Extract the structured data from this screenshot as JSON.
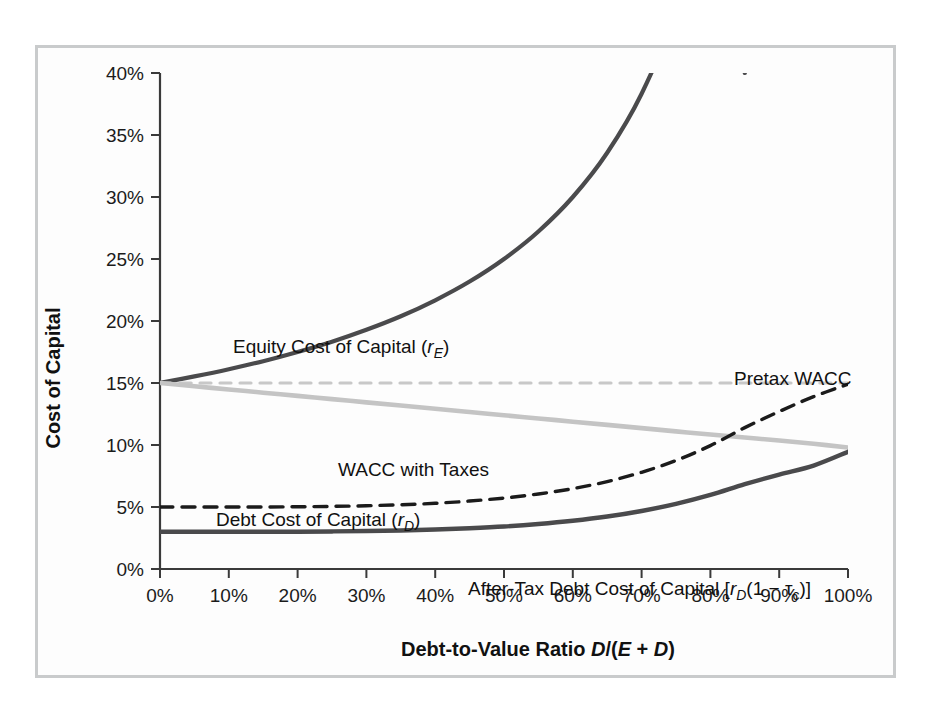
{
  "figure": {
    "background_color": "#fdfdfd",
    "border_color": "#c9cbcc"
  },
  "chart_data": {
    "type": "line",
    "title": "",
    "xlabel_parts": {
      "lead": "Debt-to-Value Ratio ",
      "d": "D",
      "slash": "/(",
      "e": "E",
      "plus": " + ",
      "d2": "D",
      "close": ")"
    },
    "xlabel": "Debt-to-Value Ratio D/(E + D)",
    "ylabel": "Cost of Capital",
    "xlim": [
      0,
      100
    ],
    "ylim": [
      0,
      40
    ],
    "grid": false,
    "legend_position": "inline-annotations",
    "xticks": [
      "0%",
      "10%",
      "20%",
      "30%",
      "40%",
      "50%",
      "60%",
      "70%",
      "80%",
      "90%",
      "100%"
    ],
    "xtick_values": [
      0,
      10,
      20,
      30,
      40,
      50,
      60,
      70,
      80,
      90,
      100
    ],
    "yticks": [
      "0%",
      "5%",
      "10%",
      "15%",
      "20%",
      "25%",
      "30%",
      "35%",
      "40%"
    ],
    "ytick_values": [
      0,
      5,
      10,
      15,
      20,
      25,
      30,
      35,
      40
    ],
    "x": [
      0,
      5,
      10,
      15,
      20,
      25,
      30,
      35,
      40,
      45,
      50,
      55,
      60,
      65,
      70,
      75,
      80,
      85,
      90,
      95,
      100
    ],
    "series": [
      {
        "name": "Equity Cost of Capital",
        "symbol": "rE",
        "color": "#4a4a4c",
        "style": "solid",
        "width": 4.2,
        "values": [
          15.0,
          15.53,
          16.11,
          16.76,
          17.5,
          18.33,
          19.29,
          20.38,
          21.67,
          23.18,
          25.0,
          27.22,
          30.0,
          33.57,
          38.33,
          45.0,
          55.0,
          40.0,
          null,
          null,
          null
        ],
        "clip_top": 40,
        "label": {
          "text": "Equity Cost of Capital (r",
          "sub": "E",
          "tail": ")",
          "x_px": 195,
          "y_px": 305
        }
      },
      {
        "name": "Pretax WACC",
        "color": "#c8c8c8",
        "style": "dashed",
        "width": 3.2,
        "values": [
          15.0,
          15.0,
          15.0,
          15.0,
          15.0,
          15.0,
          15.0,
          15.0,
          15.0,
          15.0,
          15.0,
          15.0,
          15.0,
          15.0,
          15.0,
          15.0,
          15.0,
          15.0,
          15.0,
          15.0,
          15.0
        ],
        "label": {
          "text": "Pretax WACC",
          "x_px": 696,
          "y_px": 337
        }
      },
      {
        "name": "WACC with Taxes",
        "color": "#c4c4c4",
        "style": "solid",
        "width": 4.6,
        "values": [
          15.0,
          14.74,
          14.48,
          14.22,
          13.96,
          13.7,
          13.44,
          13.18,
          12.92,
          12.66,
          12.4,
          12.14,
          11.88,
          11.62,
          11.36,
          11.1,
          10.84,
          10.6,
          10.36,
          10.1,
          9.8
        ],
        "label": {
          "text": "WACC with Taxes",
          "x_px": 300,
          "y_px": 428
        }
      },
      {
        "name": "Debt Cost of Capital",
        "symbol": "rD",
        "color": "#1b1b1b",
        "style": "dashed",
        "width": 3.4,
        "values": [
          5.0,
          5.0,
          5.0,
          5.0,
          5.02,
          5.05,
          5.1,
          5.18,
          5.3,
          5.48,
          5.72,
          6.05,
          6.48,
          7.05,
          7.8,
          8.75,
          9.95,
          11.4,
          12.7,
          13.9,
          14.9
        ],
        "label": {
          "text": "Debt Cost of Capital (r",
          "sub": "D",
          "tail": ")",
          "x_px": 178,
          "y_px": 478
        }
      },
      {
        "name": "After-Tax Debt Cost of Capital",
        "symbol": "rD(1-tc)",
        "color": "#4a4a4c",
        "style": "solid",
        "width": 4.4,
        "values": [
          3.0,
          3.0,
          3.0,
          3.0,
          3.01,
          3.03,
          3.06,
          3.11,
          3.18,
          3.29,
          3.43,
          3.63,
          3.89,
          4.23,
          4.68,
          5.25,
          5.97,
          6.84,
          7.62,
          8.34,
          9.45
        ],
        "label": {
          "text_pre": "After-Tax Debt Cost of Capital [r",
          "sub": "D",
          "text_mid": "(1 − τ",
          "sub2": "c",
          "text_post": ")]",
          "x_px": 430,
          "y_px": 547
        }
      }
    ]
  }
}
